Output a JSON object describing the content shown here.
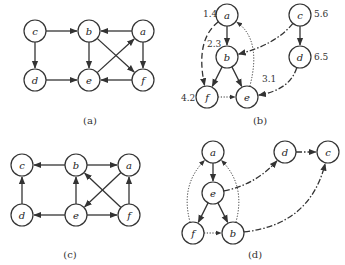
{
  "panels": [
    {
      "id": "a",
      "caption": "(a)",
      "captionPos": [
        90,
        124
      ],
      "nodes": [
        {
          "id": "c",
          "x": 35,
          "y": 31
        },
        {
          "id": "b",
          "x": 89,
          "y": 31
        },
        {
          "id": "a",
          "x": 143,
          "y": 31
        },
        {
          "id": "d",
          "x": 35,
          "y": 80
        },
        {
          "id": "e",
          "x": 89,
          "y": 80
        },
        {
          "id": "f",
          "x": 143,
          "y": 80
        }
      ],
      "edges": [
        {
          "from": "c",
          "to": "b",
          "style": "solid"
        },
        {
          "from": "a",
          "to": "b",
          "style": "solid"
        },
        {
          "from": "c",
          "to": "d",
          "style": "solid"
        },
        {
          "from": "b",
          "to": "e",
          "style": "solid"
        },
        {
          "from": "a",
          "to": "f",
          "style": "solid"
        },
        {
          "from": "d",
          "to": "e",
          "style": "solid"
        },
        {
          "from": "f",
          "to": "e",
          "style": "solid"
        },
        {
          "from": "b",
          "to": "f",
          "style": "solid"
        },
        {
          "from": "e",
          "to": "a",
          "style": "solid"
        }
      ],
      "labels": []
    },
    {
      "id": "b",
      "caption": "(b)",
      "captionPos": [
        260,
        124
      ],
      "nodes": [
        {
          "id": "a",
          "x": 227,
          "y": 15
        },
        {
          "id": "c",
          "x": 300,
          "y": 15
        },
        {
          "id": "b",
          "x": 227,
          "y": 57
        },
        {
          "id": "d",
          "x": 300,
          "y": 57
        },
        {
          "id": "f",
          "x": 207,
          "y": 97
        },
        {
          "id": "e",
          "x": 247,
          "y": 97
        }
      ],
      "edges": [
        {
          "from": "a",
          "to": "b",
          "style": "solid"
        },
        {
          "from": "b",
          "to": "f",
          "style": "solid"
        },
        {
          "from": "b",
          "to": "e",
          "style": "solid"
        },
        {
          "from": "c",
          "to": "d",
          "style": "solid"
        },
        {
          "from": "a",
          "to": "f",
          "style": "dash",
          "curve": [
            195,
            40
          ]
        },
        {
          "from": "f",
          "to": "e",
          "style": "dot"
        },
        {
          "from": "e",
          "to": "a",
          "style": "dot",
          "curve": [
            262,
            40
          ]
        },
        {
          "from": "c",
          "to": "b",
          "style": "dashdot",
          "curve": [
            275,
            45
          ]
        },
        {
          "from": "d",
          "to": "e",
          "style": "dashdot",
          "curve": [
            290,
            90
          ]
        }
      ],
      "labels": [
        {
          "text": "1.4",
          "x": 203,
          "y": 17
        },
        {
          "text": "2.3",
          "x": 207,
          "y": 47
        },
        {
          "text": "3.1",
          "x": 262,
          "y": 82
        },
        {
          "text": "4.2",
          "x": 181,
          "y": 101
        },
        {
          "text": "5.6",
          "x": 314,
          "y": 17
        },
        {
          "text": "6.5",
          "x": 314,
          "y": 60
        }
      ]
    },
    {
      "id": "c",
      "caption": "(c)",
      "captionPos": [
        70,
        258
      ],
      "nodes": [
        {
          "id": "c",
          "x": 22,
          "y": 165
        },
        {
          "id": "b",
          "x": 76,
          "y": 165
        },
        {
          "id": "a",
          "x": 129,
          "y": 165
        },
        {
          "id": "d",
          "x": 22,
          "y": 215
        },
        {
          "id": "e",
          "x": 76,
          "y": 215
        },
        {
          "id": "f",
          "x": 129,
          "y": 215
        }
      ],
      "edges": [
        {
          "from": "b",
          "to": "c",
          "style": "solid"
        },
        {
          "from": "b",
          "to": "a",
          "style": "solid"
        },
        {
          "from": "d",
          "to": "c",
          "style": "solid"
        },
        {
          "from": "e",
          "to": "b",
          "style": "solid"
        },
        {
          "from": "f",
          "to": "a",
          "style": "solid"
        },
        {
          "from": "e",
          "to": "d",
          "style": "solid"
        },
        {
          "from": "e",
          "to": "f",
          "style": "solid"
        },
        {
          "from": "f",
          "to": "b",
          "style": "solid"
        },
        {
          "from": "a",
          "to": "e",
          "style": "solid"
        }
      ],
      "labels": []
    },
    {
      "id": "d",
      "caption": "(d)",
      "captionPos": [
        255,
        258
      ],
      "nodes": [
        {
          "id": "a",
          "x": 213,
          "y": 152
        },
        {
          "id": "d",
          "x": 285,
          "y": 152
        },
        {
          "id": "c",
          "x": 328,
          "y": 152
        },
        {
          "id": "e",
          "x": 213,
          "y": 193
        },
        {
          "id": "f",
          "x": 193,
          "y": 233
        },
        {
          "id": "b",
          "x": 233,
          "y": 233
        }
      ],
      "edges": [
        {
          "from": "a",
          "to": "e",
          "style": "solid"
        },
        {
          "from": "e",
          "to": "f",
          "style": "solid"
        },
        {
          "from": "e",
          "to": "b",
          "style": "solid"
        },
        {
          "from": "f",
          "to": "b",
          "style": "dot"
        },
        {
          "from": "f",
          "to": "a",
          "style": "dot",
          "curve": [
            180,
            185
          ]
        },
        {
          "from": "b",
          "to": "a",
          "style": "dot",
          "curve": [
            246,
            185
          ]
        },
        {
          "from": "e",
          "to": "d",
          "style": "dashdot",
          "curve": [
            255,
            185
          ]
        },
        {
          "from": "d",
          "to": "c",
          "style": "dashdot"
        },
        {
          "from": "b",
          "to": "c",
          "style": "dashdot",
          "curve": [
            310,
            225
          ]
        }
      ],
      "labels": []
    }
  ]
}
